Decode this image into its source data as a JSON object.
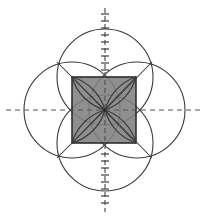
{
  "figure": {
    "canvas": {
      "width": 208,
      "height": 218,
      "background": "#ffffff"
    },
    "center": {
      "x": 105,
      "y": 110
    },
    "colors": {
      "stroke": "#3a3a3a",
      "square_fill": "#808080",
      "square_stroke": "#2e2e2e",
      "axis": "#555555",
      "background": "#ffffff"
    },
    "square": {
      "label": "central shaded square",
      "x": 72,
      "y": 77,
      "width": 64,
      "height": 66,
      "fill": "#808080",
      "stroke_width": 1.6
    },
    "circles": [
      {
        "label": "top-circle",
        "cx": 105,
        "cy": 77,
        "r": 48
      },
      {
        "label": "bottom-circle",
        "cx": 105,
        "cy": 143,
        "r": 48
      },
      {
        "label": "left-circle",
        "cx": 72,
        "cy": 110,
        "r": 48
      },
      {
        "label": "right-circle",
        "cx": 137,
        "cy": 110,
        "r": 48
      }
    ],
    "axes": [
      {
        "label": "vertical-axis",
        "orientation": "vertical",
        "x1": 105,
        "y1": 8,
        "x2": 105,
        "y2": 212,
        "dash": "5 3",
        "has_ticks": true,
        "tick_spacing": 7,
        "tick_half_length": 4
      },
      {
        "label": "horizontal-axis",
        "orientation": "horizontal",
        "x1": 6,
        "y1": 110,
        "x2": 202,
        "y2": 110,
        "dash": "5 4",
        "has_ticks": false
      }
    ],
    "petal_arcs": {
      "label": "arcs converging at center",
      "count": 8,
      "description": "quarter-arc pairs from each circle passing through the center point"
    },
    "stroke_width": 1.1
  }
}
